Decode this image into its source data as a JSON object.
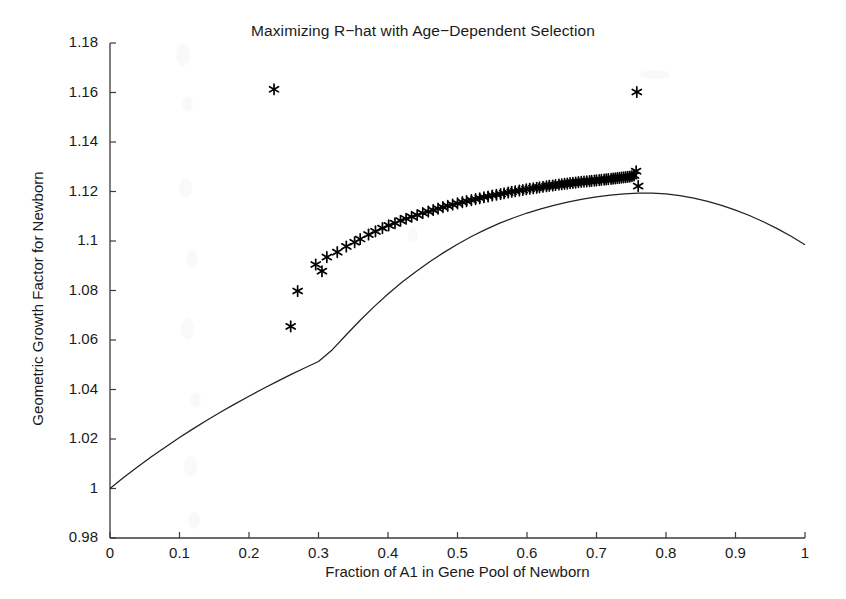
{
  "chart_data": {
    "type": "scatter",
    "title": "Maximizing R−hat with Age−Dependent Selection",
    "xlabel": "Fraction of A1 in Gene Pool of Newborn",
    "ylabel": "Geometric Growth Factor for Newborn",
    "xlim": [
      0,
      1
    ],
    "ylim": [
      0.98,
      1.18
    ],
    "xticks": [
      0,
      0.1,
      0.2,
      0.3,
      0.4,
      0.5,
      0.6,
      0.7,
      0.8,
      0.9,
      1
    ],
    "xticklabels": [
      "0",
      "0.1",
      "0.2",
      "0.3",
      "0.4",
      "0.5",
      "0.6",
      "0.7",
      "0.8",
      "0.9",
      "1"
    ],
    "yticks": [
      0.98,
      1.0,
      1.02,
      1.04,
      1.06,
      1.08,
      1.1,
      1.12,
      1.14,
      1.16,
      1.18
    ],
    "yticklabels": [
      "0.98",
      "1",
      "1.02",
      "1.04",
      "1.06",
      "1.08",
      "1.1",
      "1.12",
      "1.14",
      "1.16",
      "1.18"
    ],
    "grid": false,
    "legend": null,
    "line_color": "#222222",
    "marker_color": "#000000",
    "marker_style": "asterisk",
    "series": [
      {
        "name": "Geometric growth factor curve",
        "type": "line",
        "x": [
          0,
          0.02,
          0.04,
          0.06,
          0.08,
          0.1,
          0.12,
          0.14,
          0.16,
          0.18,
          0.2,
          0.22,
          0.24,
          0.26,
          0.28,
          0.3,
          0.32,
          0.34,
          0.36,
          0.38,
          0.4,
          0.42,
          0.44,
          0.46,
          0.48,
          0.5,
          0.52,
          0.54,
          0.56,
          0.58,
          0.6,
          0.62,
          0.64,
          0.66,
          0.68,
          0.7,
          0.72,
          0.74,
          0.76,
          0.78,
          0.8,
          0.82,
          0.84,
          0.86,
          0.88,
          0.9,
          0.92,
          0.94,
          0.96,
          0.98,
          1
        ],
        "y": [
          1.0,
          1.0045,
          1.0088,
          1.0129,
          1.0168,
          1.0206,
          1.0242,
          1.0277,
          1.031,
          1.0342,
          1.0373,
          1.0403,
          1.0432,
          1.046,
          1.0487,
          1.0513,
          1.0561,
          1.0621,
          1.068,
          1.0735,
          1.0786,
          1.0833,
          1.0876,
          1.0916,
          1.0953,
          1.0987,
          1.1018,
          1.1046,
          1.1071,
          1.1093,
          1.1113,
          1.113,
          1.1145,
          1.1158,
          1.1169,
          1.1178,
          1.1185,
          1.119,
          1.1193,
          1.1193,
          1.119,
          1.1183,
          1.1173,
          1.116,
          1.1144,
          1.1125,
          1.1103,
          1.1078,
          1.105,
          1.1019,
          1.0985
        ]
      },
      {
        "name": "Optimal genotype samples",
        "type": "scatter",
        "x": [
          0.236,
          0.758,
          0.26,
          0.27,
          0.296,
          0.305,
          0.312,
          0.327,
          0.34,
          0.352,
          0.36,
          0.372,
          0.382,
          0.392,
          0.401,
          0.41,
          0.418,
          0.426,
          0.434,
          0.442,
          0.45,
          0.458,
          0.465,
          0.472,
          0.479,
          0.486,
          0.493,
          0.5,
          0.507,
          0.513,
          0.52,
          0.526,
          0.532,
          0.538,
          0.544,
          0.55,
          0.556,
          0.562,
          0.567,
          0.573,
          0.578,
          0.583,
          0.589,
          0.594,
          0.599,
          0.604,
          0.609,
          0.614,
          0.618,
          0.623,
          0.628,
          0.632,
          0.637,
          0.641,
          0.646,
          0.65,
          0.654,
          0.658,
          0.662,
          0.666,
          0.67,
          0.674,
          0.678,
          0.682,
          0.686,
          0.69,
          0.693,
          0.697,
          0.7,
          0.704,
          0.707,
          0.711,
          0.714,
          0.717,
          0.721,
          0.724,
          0.727,
          0.73,
          0.733,
          0.736,
          0.739,
          0.742,
          0.745,
          0.748,
          0.751,
          0.754,
          0.757,
          0.76
        ],
        "y": [
          1.1613,
          1.1602,
          1.0655,
          1.0798,
          1.0905,
          1.0878,
          1.0935,
          1.0955,
          1.0978,
          1.0995,
          1.1008,
          1.1026,
          1.1039,
          1.1052,
          1.1063,
          1.1072,
          1.1082,
          1.109,
          1.1098,
          1.1105,
          1.1113,
          1.1119,
          1.1125,
          1.1131,
          1.1137,
          1.1142,
          1.1147,
          1.1152,
          1.1157,
          1.1161,
          1.1165,
          1.1169,
          1.1173,
          1.1177,
          1.118,
          1.1184,
          1.1187,
          1.119,
          1.1193,
          1.1196,
          1.1199,
          1.1201,
          1.1204,
          1.1206,
          1.1209,
          1.1211,
          1.1213,
          1.1215,
          1.1217,
          1.1219,
          1.1221,
          1.1223,
          1.1224,
          1.1226,
          1.1228,
          1.1229,
          1.1231,
          1.1232,
          1.1234,
          1.1235,
          1.1236,
          1.1238,
          1.1239,
          1.124,
          1.1241,
          1.1242,
          1.1243,
          1.1244,
          1.1245,
          1.1246,
          1.1247,
          1.1248,
          1.1249,
          1.125,
          1.1251,
          1.1252,
          1.1253,
          1.1254,
          1.1255,
          1.1256,
          1.1257,
          1.1258,
          1.1259,
          1.126,
          1.1262,
          1.1265,
          1.1282,
          1.1222
        ]
      }
    ]
  }
}
